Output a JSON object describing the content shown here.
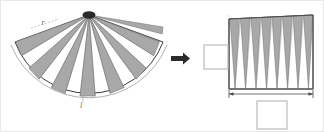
{
  "figure": {
    "background_color": "#ffffff",
    "border_color": "#e8e8e8",
    "wedge_fill_color": "#a8a8a8",
    "wedge_stroke_color": "#6e6e6e",
    "outline_color": "#3c3c3c",
    "callout_border_color": "#b4b4b4",
    "leader_color": "#c0c0c0",
    "arrow_color": "#2b2b2b"
  },
  "left_panel": {
    "name": "sector-fan",
    "shape": "circular sector fanned into alternating wedges",
    "apex": {
      "x": 88,
      "y": 14
    },
    "radius": 78,
    "start_angle_deg": 20,
    "end_angle_deg": 160,
    "wedge_count": 16,
    "shaded_wedge_count": 8,
    "labels": [
      {
        "name": "radius-label",
        "text": "r",
        "x": 42,
        "y": 22
      },
      {
        "name": "arc-length-label",
        "text": "l",
        "x": 80,
        "y": 101
      }
    ],
    "outer_arc": {
      "name": "outer-arc",
      "description": "thin arc drawn outside the shaded sector"
    }
  },
  "arrow": {
    "name": "transform-arrow",
    "direction": "right",
    "x": 170,
    "y": 57,
    "width": 18,
    "height": 11,
    "color": "#2b2b2b"
  },
  "right_panel": {
    "name": "rectangle-assembly",
    "shape": "wedges interleaved into a rectangle",
    "rect": {
      "x": 228,
      "y": 14,
      "width": 84,
      "height": 74
    },
    "triangle_count": 8,
    "slant_top_offset": 4,
    "dimension_line": {
      "name": "width-dimension",
      "x1": 228,
      "x2": 312,
      "y": 93,
      "double_headed": true
    },
    "callouts": [
      {
        "name": "height-callout-box",
        "x": 203,
        "y": 44,
        "width": 24,
        "height": 24,
        "text": ""
      },
      {
        "name": "width-callout-box",
        "x": 256,
        "y": 100,
        "width": 30,
        "height": 28,
        "text": ""
      }
    ],
    "leader_lines": {
      "name": "callout-leaders",
      "style": "dashed",
      "from": "height-callout-box",
      "to": "rectangle-left-edge"
    }
  }
}
